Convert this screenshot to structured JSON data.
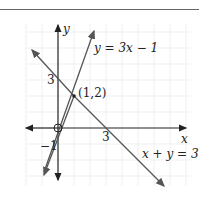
{
  "diagram": {
    "axes": {
      "x_label": "x",
      "y_label": "y"
    },
    "lines": [
      {
        "equation": "y = 3x − 1",
        "slope": 3,
        "intercept": -1
      },
      {
        "equation": "x + y = 3",
        "slope": -1,
        "intercept": 3
      }
    ],
    "intersection": {
      "label": "(1,2)",
      "x": 1,
      "y": 2
    },
    "tick_labels": {
      "y_intercept_line2": "3",
      "y_intercept_line1": "−1",
      "x_intercept_line2": "3",
      "origin": "O"
    },
    "colors": {
      "axis": "#222222",
      "line": "#555555",
      "grid": "#eeeeee"
    }
  }
}
